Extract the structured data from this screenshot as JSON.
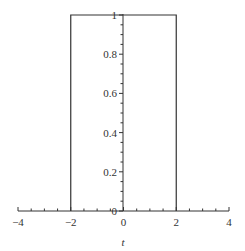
{
  "chart_data": {
    "type": "line",
    "title": "",
    "xlabel": "t",
    "ylabel": "",
    "xlim": [
      -4,
      4
    ],
    "ylim": [
      0,
      1
    ],
    "grid": false,
    "legend": null,
    "x_ticks": [
      -4,
      -2,
      0,
      2,
      4
    ],
    "x_tick_labels": [
      "−4",
      "−2",
      "0",
      "2",
      "4"
    ],
    "x_minor_step": 0.5,
    "y_ticks": [
      0,
      0.2,
      0.4,
      0.6,
      0.8,
      1
    ],
    "y_tick_labels": [
      "0",
      "0.2",
      "0.4",
      "0.6",
      "0.8",
      "1"
    ],
    "y_minor_step": 0.05,
    "series": [
      {
        "name": "rectangular pulse",
        "x": [
          -2,
          -2,
          2,
          2
        ],
        "y": [
          0,
          1,
          1,
          0
        ]
      }
    ]
  }
}
